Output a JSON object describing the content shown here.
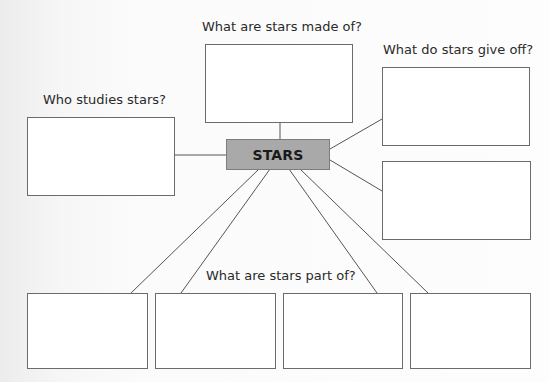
{
  "diagram": {
    "center": {
      "label": "STARS",
      "fill": "#a9a9a9"
    },
    "questions": {
      "made_of": "What are stars made of?",
      "give_off": "What do stars give off?",
      "who_studies": "Who studies stars?",
      "part_of": "What are stars part of?"
    },
    "answer_boxes": [
      {
        "id": "made-of",
        "group": "What are stars made of?",
        "value": ""
      },
      {
        "id": "give-off-1",
        "group": "What do stars give off?",
        "value": ""
      },
      {
        "id": "give-off-2",
        "group": "What do stars give off?",
        "value": ""
      },
      {
        "id": "who-studies",
        "group": "Who studies stars?",
        "value": ""
      },
      {
        "id": "part-of-1",
        "group": "What are stars part of?",
        "value": ""
      },
      {
        "id": "part-of-2",
        "group": "What are stars part of?",
        "value": ""
      },
      {
        "id": "part-of-3",
        "group": "What are stars part of?",
        "value": ""
      },
      {
        "id": "part-of-4",
        "group": "What are stars part of?",
        "value": ""
      }
    ],
    "line_color": "#555555"
  }
}
